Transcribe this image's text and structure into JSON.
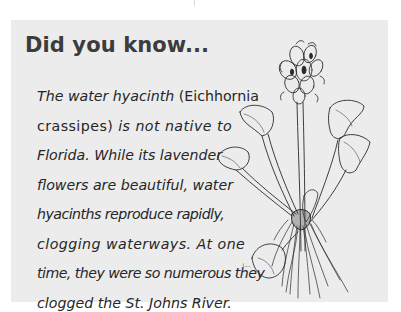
{
  "callout": {
    "heading": "Did you know...",
    "lines": [
      {
        "segments": [
          {
            "text": "The water hyacinth ",
            "italic": true
          },
          {
            "text": "(Eichhornia",
            "italic": false
          }
        ]
      },
      {
        "segments": [
          {
            "text": "crassipes) ",
            "italic": false
          },
          {
            "text": "is not native to",
            "italic": true
          }
        ]
      },
      {
        "segments": [
          {
            "text": "Florida. While its lavender",
            "italic": true
          }
        ]
      },
      {
        "segments": [
          {
            "text": "flowers are beautiful, water",
            "italic": true
          }
        ]
      },
      {
        "segments": [
          {
            "text": "hyacinths reproduce rapidly,",
            "italic": true
          }
        ]
      },
      {
        "segments": [
          {
            "text": "clogging waterways. At one",
            "italic": true
          }
        ]
      },
      {
        "segments": [
          {
            "text": "time, they were so numerous they",
            "italic": true
          }
        ]
      },
      {
        "segments": [
          {
            "text": "clogged the St. Johns River.",
            "italic": true
          }
        ]
      }
    ],
    "illustration": {
      "subject": "water-hyacinth-plant-drawing",
      "artist_mark": "J—"
    }
  },
  "colors": {
    "callout_background": "#ececec",
    "heading": "#3c3c3c",
    "body_text": "#262626",
    "ink": "#2a2a2a"
  }
}
